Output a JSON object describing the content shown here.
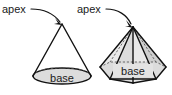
{
  "figure": {
    "background_color": "#ffffff",
    "line_color": "#111111",
    "hidden_line_color": "#5a5a5a",
    "shade_color": "#dcdcdc",
    "text_color": "#1a1a1a"
  },
  "labels": {
    "cone_apex": "apex",
    "pyramid_apex": "apex",
    "cone_base": "base",
    "pyramid_base": "base"
  },
  "shapes": [
    {
      "name": "cone",
      "apex": {
        "x": 62,
        "y": 24
      },
      "base_center": {
        "x": 62,
        "y": 76
      },
      "base_radius_x": 29,
      "base_radius_y": 8,
      "base_label": "base",
      "apex_label": "apex"
    },
    {
      "name": "hexagonal-pyramid",
      "apex": {
        "x": 133,
        "y": 27
      },
      "base_center": {
        "x": 133,
        "y": 72
      },
      "base_radius_x": 34,
      "base_radius_y": 10,
      "base_sides": 6,
      "base_label": "base",
      "apex_label": "apex"
    }
  ],
  "annotations": [
    {
      "name": "cone-apex-leader",
      "from": {
        "x": 31,
        "y": 9
      },
      "to": {
        "x": 61,
        "y": 24
      },
      "style": "curved-arrow"
    },
    {
      "name": "pyramid-apex-leader",
      "from": {
        "x": 106,
        "y": 9
      },
      "to": {
        "x": 132,
        "y": 26
      },
      "style": "curved-arrow"
    }
  ]
}
